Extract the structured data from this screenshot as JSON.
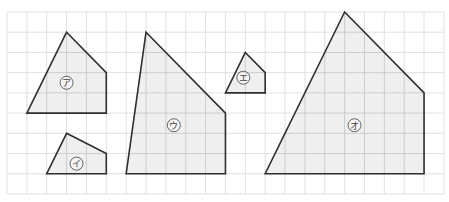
{
  "figure": {
    "grid": {
      "origin_px": [
        7,
        12
      ],
      "cell_px": [
        19.86,
        20.22
      ],
      "cols": 22,
      "rows": 9,
      "line_color": "#d9d9d9",
      "inner_line_color": "#c4c4c4"
    },
    "style": {
      "fill": "#efefef",
      "stroke": "#2f2f2f"
    },
    "shapes": [
      {
        "id": "a",
        "label": "ア",
        "points": [
          [
            3,
            1
          ],
          [
            5,
            3
          ],
          [
            5,
            5
          ],
          [
            1,
            5
          ]
        ],
        "label_pos": [
          3,
          3.5
        ]
      },
      {
        "id": "i",
        "label": "イ",
        "points": [
          [
            3,
            6
          ],
          [
            5,
            7
          ],
          [
            5,
            8
          ],
          [
            2,
            8
          ]
        ],
        "label_pos": [
          3.5,
          7.5
        ]
      },
      {
        "id": "u",
        "label": "ウ",
        "points": [
          [
            7,
            1
          ],
          [
            11,
            5
          ],
          [
            11,
            8
          ],
          [
            6,
            8
          ]
        ],
        "label_pos": [
          8.4,
          5.6
        ]
      },
      {
        "id": "e",
        "label": "エ",
        "points": [
          [
            12,
            2
          ],
          [
            13,
            3
          ],
          [
            13,
            4
          ],
          [
            11,
            4
          ]
        ],
        "label_pos": [
          11.9,
          3.25
        ]
      },
      {
        "id": "o",
        "label": "オ",
        "points": [
          [
            17,
            0
          ],
          [
            21,
            4
          ],
          [
            21,
            8
          ],
          [
            13,
            8
          ]
        ],
        "label_pos": [
          17.5,
          5.6
        ]
      }
    ]
  }
}
